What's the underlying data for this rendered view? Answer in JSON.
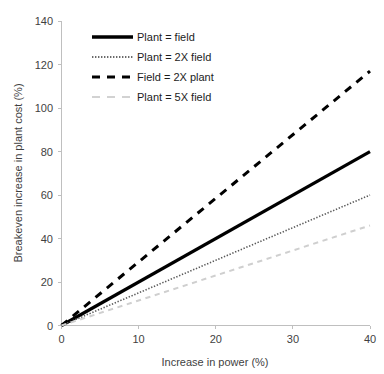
{
  "chart_data": {
    "type": "line",
    "title": "",
    "xlabel": "Increase in power (%)",
    "ylabel": "Breakeven increase in plant cost (%)",
    "xlim": [
      0,
      40
    ],
    "ylim": [
      0,
      140
    ],
    "xticks": [
      "0",
      "10",
      "20",
      "30",
      "40"
    ],
    "yticks": [
      "0",
      "20",
      "40",
      "60",
      "80",
      "100",
      "120",
      "140"
    ],
    "grid": false,
    "legend_position": "upper-left-inside",
    "x": [
      0,
      40
    ],
    "series": [
      {
        "name": "Plant = field",
        "values": [
          0,
          80
        ],
        "color": "#000000",
        "style": "solid",
        "width": 3.2
      },
      {
        "name": "Plant = 2X field",
        "values": [
          0,
          60
        ],
        "color": "#5a5a5a",
        "style": "dotted",
        "width": 1.6
      },
      {
        "name": "Field = 2X plant",
        "values": [
          0,
          117
        ],
        "color": "#000000",
        "style": "dashed",
        "width": 3.0
      },
      {
        "name": "Plant = 5X field",
        "values": [
          0,
          46
        ],
        "color": "#cfcfcf",
        "style": "dashed",
        "width": 2.0
      }
    ]
  },
  "axes": {
    "y_title": "Breakeven increase in plant cost (%)",
    "x_title": "Increase in power (%)",
    "y_tick_0": "0",
    "y_tick_1": "20",
    "y_tick_2": "40",
    "y_tick_3": "60",
    "y_tick_4": "80",
    "y_tick_5": "100",
    "y_tick_6": "120",
    "y_tick_7": "140",
    "x_tick_0": "0",
    "x_tick_1": "10",
    "x_tick_2": "20",
    "x_tick_3": "30",
    "x_tick_4": "40"
  },
  "legend": {
    "items": [
      {
        "label": "Plant = field"
      },
      {
        "label": "Plant = 2X field"
      },
      {
        "label": "Field = 2X plant"
      },
      {
        "label": "Plant = 5X field"
      }
    ]
  },
  "colors": {
    "axis": "#bfbfbf",
    "text": "#3f3f3f",
    "series_solid": "#000000",
    "series_dotted": "#5a5a5a",
    "series_dashed": "#000000",
    "series_light_dashed": "#cfcfcf",
    "background": "#ffffff"
  }
}
